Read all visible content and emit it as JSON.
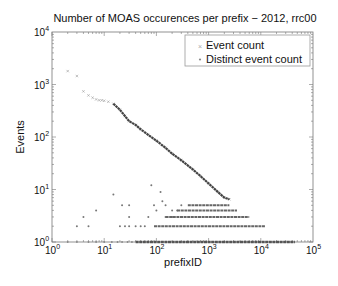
{
  "chart_data": {
    "type": "scatter",
    "title": "Number of MOAS occurences per prefix − 2012, rrc00",
    "xlabel": "prefixID",
    "ylabel": "Events",
    "xscale": "log",
    "yscale": "log",
    "xlim": [
      1,
      100000
    ],
    "ylim": [
      1,
      10000
    ],
    "x_ticks": [
      "10^0",
      "10^1",
      "10^2",
      "10^3",
      "10^4",
      "10^5"
    ],
    "y_ticks": [
      "10^0",
      "10^1",
      "10^2",
      "10^3",
      "10^4"
    ],
    "grid": false,
    "legend_position": "upper right",
    "legend": [
      "Event count",
      "Distinct event count"
    ],
    "series": [
      {
        "name": "Event count",
        "marker": "x",
        "color": "#9a9a9a",
        "points": [
          [
            2,
            1800
          ],
          [
            3,
            1450
          ],
          [
            4,
            740
          ],
          [
            5,
            620
          ],
          [
            6,
            560
          ],
          [
            7,
            520
          ],
          [
            8,
            500
          ],
          [
            9,
            500
          ],
          [
            10,
            490
          ],
          [
            12,
            470
          ],
          [
            15,
            430
          ],
          [
            20,
            330
          ],
          [
            25,
            250
          ],
          [
            30,
            200
          ],
          [
            40,
            170
          ],
          [
            50,
            140
          ],
          [
            70,
            110
          ],
          [
            100,
            85
          ],
          [
            150,
            62
          ],
          [
            200,
            48
          ],
          [
            300,
            36
          ],
          [
            500,
            24
          ],
          [
            700,
            18
          ],
          [
            1000,
            13
          ],
          [
            1500,
            9
          ],
          [
            2000,
            7
          ],
          [
            2500,
            6.5
          ]
        ]
      },
      {
        "name": "Distinct event count",
        "marker": ".",
        "color": "#555555",
        "points": [
          [
            3,
            2
          ],
          [
            5,
            2
          ],
          [
            4,
            3
          ],
          [
            7,
            4
          ],
          [
            20,
            2
          ],
          [
            25,
            2
          ],
          [
            30,
            2
          ],
          [
            40,
            2
          ],
          [
            50,
            2
          ],
          [
            15,
            8
          ],
          [
            22,
            5
          ],
          [
            30,
            5
          ],
          [
            30,
            3
          ],
          [
            60,
            2
          ],
          [
            70,
            3
          ],
          [
            80,
            12
          ],
          [
            90,
            5
          ],
          [
            100,
            4
          ],
          [
            120,
            9
          ],
          [
            130,
            6
          ],
          [
            150,
            5
          ],
          [
            150,
            3
          ],
          [
            200,
            4
          ],
          [
            200,
            3
          ],
          [
            250,
            4
          ],
          [
            300,
            5
          ],
          [
            300,
            3
          ]
        ],
        "bands": [
          {
            "y": 1,
            "x_from": 40,
            "x_to": 45000
          },
          {
            "y": 2,
            "x_from": 90,
            "x_to": 12000
          },
          {
            "y": 3,
            "x_from": 150,
            "x_to": 6000
          },
          {
            "y": 4,
            "x_from": 250,
            "x_to": 3500
          },
          {
            "y": 5,
            "x_from": 400,
            "x_to": 2500
          }
        ]
      }
    ]
  }
}
